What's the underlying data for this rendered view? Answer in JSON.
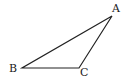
{
  "diagram": {
    "type": "triangle",
    "vertices": [
      {
        "label": "A",
        "x": 112,
        "y": 16,
        "label_x": 112,
        "label_y": 12
      },
      {
        "label": "B",
        "x": 22,
        "y": 68,
        "label_x": 9,
        "label_y": 72
      },
      {
        "label": "C",
        "x": 79,
        "y": 68,
        "label_x": 80,
        "label_y": 76
      }
    ],
    "edges": [
      [
        "A",
        "B"
      ],
      [
        "B",
        "C"
      ],
      [
        "C",
        "A"
      ]
    ],
    "stroke_color": "#222222"
  }
}
